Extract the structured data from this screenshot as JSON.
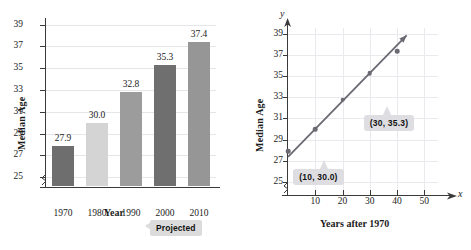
{
  "chart_data": [
    {
      "type": "bar",
      "title": "",
      "xlabel": "Year",
      "ylabel": "Median Age",
      "categories": [
        "1970",
        "1980",
        "1990",
        "2000",
        "2010"
      ],
      "values": [
        27.9,
        30.0,
        32.8,
        35.3,
        37.4
      ],
      "value_labels": [
        "27.9",
        "30.0",
        "32.8",
        "35.3",
        "37.4"
      ],
      "bar_colors": [
        "#6e6e6e",
        "#d4d4d4",
        "#9c9c9c",
        "#6f6f6f",
        "#969696"
      ],
      "ylim": [
        24.2,
        39.6
      ],
      "yticks": [
        25,
        27,
        29,
        31,
        33,
        35,
        37,
        39
      ],
      "ytick_labels": [
        "25",
        "27",
        "29",
        "31",
        "33",
        "35",
        "37",
        "39"
      ],
      "grid": true,
      "axis_break": true,
      "annotation": "Projected",
      "annotation_target": "2010"
    },
    {
      "type": "scatter",
      "title": "",
      "xlabel": "Years after 1970",
      "ylabel": "Median Age",
      "x_axis_name": "x",
      "y_axis_name": "y",
      "x": [
        0,
        10,
        20,
        30,
        40
      ],
      "y": [
        27.9,
        30.0,
        32.8,
        35.3,
        37.4
      ],
      "xlim": [
        0,
        55
      ],
      "ylim": [
        24.2,
        39.6
      ],
      "xticks": [
        10,
        20,
        30,
        40,
        50
      ],
      "xtick_labels": [
        "10",
        "20",
        "30",
        "40",
        "50"
      ],
      "yticks": [
        25,
        27,
        29,
        31,
        33,
        35,
        37,
        39
      ],
      "ytick_labels": [
        "25",
        "27",
        "29",
        "31",
        "33",
        "35",
        "37",
        "39"
      ],
      "grid": true,
      "axis_break": true,
      "trendline": {
        "label": "best fit line",
        "x_start": 0,
        "y_start": 27.35,
        "x_end": 43.5,
        "y_end": 38.9,
        "color": "#6a6a72"
      },
      "annotations": [
        {
          "text": "(10, 30.0)",
          "point_x": 10,
          "point_y": 30.0
        },
        {
          "text": "(30, 35.3)",
          "point_x": 30,
          "point_y": 35.3
        }
      ],
      "point_color": "#6a6a72"
    }
  ]
}
